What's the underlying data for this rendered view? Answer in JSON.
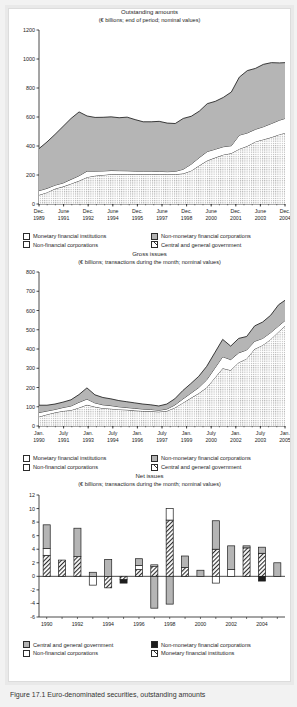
{
  "figure": {
    "caption": "Figure 17.1 Euro-denominated securities, outstanding amounts"
  },
  "legend_labels": {
    "mfi": "Monetary financial institutions",
    "nmfc": "Non-monetary financial corporations",
    "nfc": "Non-financial corporations",
    "cgg": "Central and general government"
  },
  "chart_data": [
    {
      "id": "outstanding-amounts",
      "type": "area",
      "title": "Outstanding amounts",
      "subtitle": "(€ billions; end of period; nominal values)",
      "stacked": true,
      "ylim": [
        0,
        1200
      ],
      "yticks": [
        0,
        200,
        400,
        600,
        800,
        1000,
        1200
      ],
      "ylabel": "",
      "xlabel": "",
      "grid": false,
      "legend_position": "below",
      "xticklabels": [
        "Dec.\n1989",
        "June\n1991",
        "Dec.\n1992",
        "June\n1994",
        "Dec.\n1995",
        "June\n1997",
        "Dec.\n1998",
        "June\n2000",
        "Dec.\n2001",
        "June\n2003",
        "Dec.\n2004"
      ],
      "xtick_lines": [
        "Dec.",
        "June",
        "Dec.",
        "June",
        "Dec.",
        "June",
        "Dec.",
        "June",
        "Dec.",
        "June",
        "Dec."
      ],
      "xtick_years": [
        "1989",
        "1991",
        "1992",
        "1994",
        "1995",
        "1997",
        "1998",
        "2000",
        "2001",
        "2003",
        "2004"
      ],
      "x": [
        1989.95,
        1990.45,
        1990.95,
        1991.45,
        1991.95,
        1992.45,
        1992.95,
        1993.45,
        1993.95,
        1994.45,
        1994.95,
        1995.45,
        1995.95,
        1996.45,
        1996.95,
        1997.45,
        1997.95,
        1998.45,
        1998.95,
        1999.45,
        1999.95,
        2000.45,
        2000.95,
        2001.45,
        2001.95,
        2002.45,
        2002.95,
        2003.45,
        2003.95,
        2004.45,
        2004.95,
        2005.3
      ],
      "series": [
        {
          "name": "Monetary financial institutions",
          "fill": "dotted",
          "values": [
            62,
            80,
            105,
            120,
            140,
            160,
            185,
            195,
            200,
            205,
            205,
            205,
            205,
            205,
            205,
            205,
            205,
            205,
            210,
            230,
            265,
            300,
            320,
            340,
            350,
            380,
            400,
            430,
            445,
            460,
            480,
            490
          ]
        },
        {
          "name": "Non-financial corporations",
          "fill": "white",
          "values": [
            30,
            28,
            25,
            25,
            30,
            35,
            42,
            32,
            28,
            26,
            25,
            24,
            22,
            22,
            22,
            20,
            18,
            20,
            30,
            45,
            55,
            62,
            58,
            55,
            52,
            95,
            90,
            85,
            88,
            95,
            98,
            100
          ]
        },
        {
          "name": "Non-monetary financial corporations",
          "fill": "gray",
          "values": [
            290,
            320,
            350,
            390,
            420,
            440,
            380,
            370,
            370,
            370,
            365,
            370,
            355,
            340,
            340,
            345,
            335,
            330,
            350,
            330,
            320,
            330,
            330,
            340,
            370,
            400,
            430,
            420,
            430,
            420,
            395,
            385
          ]
        },
        {
          "name": "Central and general government",
          "fill": "hatched",
          "values": [
            0,
            0,
            0,
            0,
            0,
            0,
            0,
            0,
            0,
            0,
            0,
            0,
            0,
            0,
            0,
            0,
            0,
            0,
            0,
            0,
            0,
            0,
            0,
            0,
            0,
            0,
            0,
            0,
            0,
            0,
            0,
            0
          ]
        }
      ],
      "totals_note": "Top of stack rises from about 385 in Dec. 1989 to about 975 in Dec. 2004"
    },
    {
      "id": "gross-issues",
      "type": "area",
      "title": "Gross issues",
      "subtitle": "(€ billions; transactions during the month; nominal values)",
      "stacked": true,
      "ylim": [
        0,
        800
      ],
      "yticks": [
        0,
        100,
        200,
        300,
        400,
        500,
        600,
        700,
        800
      ],
      "grid": false,
      "legend_position": "below",
      "xtick_lines": [
        "Jan.",
        "July",
        "Jan.",
        "July",
        "Jan.",
        "July",
        "Jan.",
        "July",
        "Jan.",
        "July",
        "Jan."
      ],
      "xtick_years": [
        "1990",
        "1991",
        "1993",
        "1994",
        "1996",
        "1997",
        "1999",
        "2000",
        "2002",
        "2003",
        "2005"
      ],
      "x": [
        1990.0,
        1990.5,
        1991.0,
        1991.5,
        1992.0,
        1992.5,
        1993.0,
        1993.5,
        1994.0,
        1994.5,
        1995.0,
        1995.5,
        1996.0,
        1996.5,
        1997.0,
        1997.5,
        1998.0,
        1998.5,
        1999.0,
        1999.5,
        2000.0,
        2000.5,
        2001.0,
        2001.5,
        2002.0,
        2002.5,
        2003.0,
        2003.5,
        2004.0,
        2004.5,
        2005.0,
        2005.4
      ],
      "series": [
        {
          "name": "Monetary financial institutions",
          "fill": "dotted",
          "values": [
            48,
            60,
            70,
            78,
            82,
            95,
            110,
            100,
            92,
            90,
            86,
            84,
            80,
            78,
            76,
            74,
            78,
            95,
            120,
            145,
            170,
            200,
            250,
            300,
            290,
            330,
            350,
            400,
            420,
            450,
            490,
            520
          ]
        },
        {
          "name": "Non-financial corporations",
          "fill": "white",
          "values": [
            22,
            18,
            16,
            18,
            22,
            28,
            30,
            20,
            18,
            16,
            14,
            12,
            12,
            10,
            10,
            8,
            10,
            14,
            20,
            25,
            30,
            40,
            50,
            60,
            55,
            50,
            45,
            40,
            35,
            35,
            30,
            28
          ]
        },
        {
          "name": "Non-monetary financial corporations",
          "fill": "gray",
          "values": [
            38,
            30,
            28,
            28,
            32,
            40,
            58,
            42,
            38,
            35,
            32,
            30,
            28,
            26,
            24,
            22,
            26,
            32,
            44,
            50,
            58,
            70,
            80,
            90,
            70,
            75,
            70,
            80,
            85,
            90,
            110,
            105
          ]
        },
        {
          "name": "Central and general government",
          "fill": "hatched",
          "values": [
            0,
            0,
            0,
            0,
            0,
            0,
            0,
            0,
            0,
            0,
            0,
            0,
            0,
            0,
            0,
            0,
            0,
            0,
            0,
            0,
            0,
            0,
            0,
            0,
            0,
            0,
            0,
            0,
            0,
            0,
            0,
            0
          ]
        }
      ],
      "totals_note": "Monthly total rises from about 110 in Jan. 1990 to peaks above 700 in 2005"
    },
    {
      "id": "net-issues",
      "type": "bar",
      "title": "Net issues",
      "subtitle": "(€ billions; transactions during the month; nominal values)",
      "stacked": true,
      "ylim": [
        -6,
        12
      ],
      "yticks": [
        -6,
        -4,
        -2,
        0,
        2,
        4,
        6,
        8,
        10,
        12
      ],
      "grid": false,
      "legend_position": "below",
      "categories": [
        "1990",
        "1991",
        "1992",
        "1993",
        "1994",
        "1995",
        "1996",
        "1997",
        "1998",
        "1999",
        "2000",
        "2001",
        "2002",
        "2003",
        "2004",
        "2005"
      ],
      "xticklabels": [
        "1990",
        "1992",
        "1994",
        "1996",
        "1998",
        "2000",
        "2002",
        "2004"
      ],
      "series": [
        {
          "name": "Monetary financial institutions",
          "fill": "hatched",
          "values": [
            3.1,
            2.4,
            2.9,
            0.0,
            -1.7,
            -0.5,
            1.0,
            1.5,
            8.3,
            1.3,
            0.0,
            4.0,
            0.0,
            4.2,
            3.4,
            0.0
          ]
        },
        {
          "name": "Non-financial corporations",
          "fill": "white",
          "values": [
            1.0,
            0.0,
            0.0,
            -1.3,
            0.0,
            0.0,
            0.6,
            0.2,
            1.7,
            0.0,
            0.0,
            -1.0,
            1.0,
            0.0,
            0.0,
            0.0
          ]
        },
        {
          "name": "Non-monetary financial corporations",
          "fill": "black",
          "values": [
            0.0,
            0.0,
            0.0,
            0.0,
            0.0,
            -0.5,
            0.0,
            0.0,
            0.0,
            0.0,
            0.0,
            0.0,
            0.0,
            0.0,
            -0.7,
            0.0
          ]
        },
        {
          "name": "Central and general government",
          "fill": "gray",
          "values": [
            3.5,
            0.0,
            4.2,
            0.6,
            2.5,
            0.0,
            1.0,
            -4.7,
            -4.1,
            1.7,
            0.9,
            4.2,
            3.5,
            0.3,
            0.9,
            2.0
          ]
        }
      ],
      "bar_tops": [
        7.6,
        2.4,
        7.1,
        0.7,
        2.5,
        -0.5,
        1.7,
        1.5,
        10.0,
        3.0,
        2.8,
        8.2,
        4.5,
        4.3,
        5.4,
        0.0
      ],
      "bar_bottoms": [
        0,
        0,
        0,
        -1.3,
        -0.4,
        -0.6,
        0,
        -4.7,
        -4.1,
        -1.6,
        -0.8,
        -1.0,
        0,
        0,
        -0.8,
        0
      ]
    }
  ]
}
